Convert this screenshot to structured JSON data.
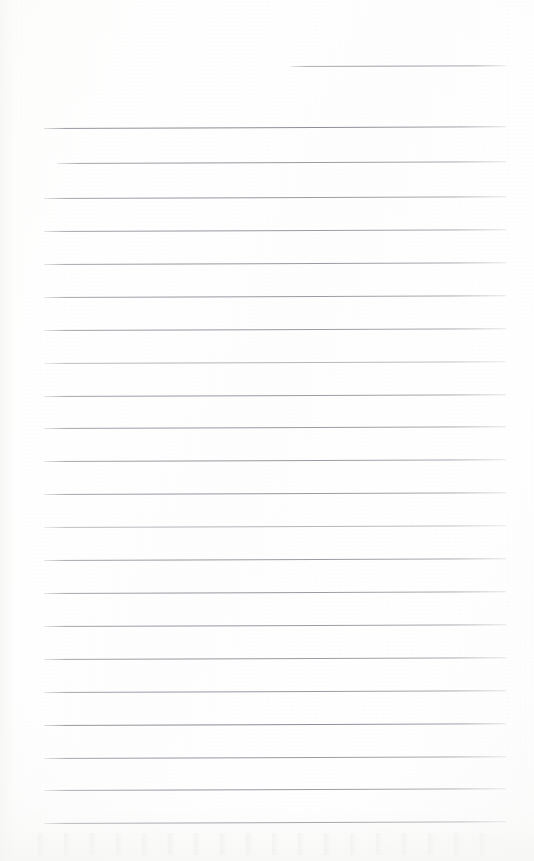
{
  "document": {
    "kind": "scanned-ruled-notebook-page",
    "title": "Blank Ruled Notebook Page",
    "description": "A scanned blank sheet of ruled notepaper. No handwriting, printed text, headings or page numbers are visible anywhere on the page.",
    "page_width": 534,
    "page_height": 861,
    "text_content": "",
    "has_visible_text": false,
    "paper_color": "#fefefe",
    "rule_color": "#9a9ca4",
    "rule_count": 24,
    "rule_left": 44,
    "rule_right": 506,
    "rule_spacing": 32.7,
    "skew_degrees": -0.22
  },
  "rules": [
    {
      "id": "rule-partial-top",
      "y": 66,
      "left": 290,
      "right": 506,
      "weight": "partial"
    },
    {
      "id": "rule-1",
      "y": 128,
      "left": 44,
      "right": 506,
      "weight": "strong"
    },
    {
      "id": "rule-2",
      "y": 163,
      "left": 57,
      "right": 506,
      "weight": "normal"
    },
    {
      "id": "rule-3",
      "y": 198,
      "left": 44,
      "right": 506,
      "weight": "normal"
    },
    {
      "id": "rule-4",
      "y": 231,
      "left": 44,
      "right": 506,
      "weight": "normal"
    },
    {
      "id": "rule-5",
      "y": 264,
      "left": 44,
      "right": 506,
      "weight": "normal"
    },
    {
      "id": "rule-6",
      "y": 297,
      "left": 44,
      "right": 506,
      "weight": "normal"
    },
    {
      "id": "rule-7",
      "y": 330,
      "left": 44,
      "right": 506,
      "weight": "normal"
    },
    {
      "id": "rule-8",
      "y": 363,
      "left": 44,
      "right": 506,
      "weight": "faint"
    },
    {
      "id": "rule-9",
      "y": 396,
      "left": 44,
      "right": 506,
      "weight": "normal"
    },
    {
      "id": "rule-10",
      "y": 428,
      "left": 44,
      "right": 506,
      "weight": "normal"
    },
    {
      "id": "rule-11",
      "y": 461,
      "left": 44,
      "right": 506,
      "weight": "normal"
    },
    {
      "id": "rule-12",
      "y": 494,
      "left": 44,
      "right": 506,
      "weight": "normal"
    },
    {
      "id": "rule-13",
      "y": 527,
      "left": 44,
      "right": 506,
      "weight": "faint"
    },
    {
      "id": "rule-14",
      "y": 560,
      "left": 44,
      "right": 506,
      "weight": "normal"
    },
    {
      "id": "rule-15",
      "y": 593,
      "left": 44,
      "right": 506,
      "weight": "normal"
    },
    {
      "id": "rule-16",
      "y": 626,
      "left": 44,
      "right": 506,
      "weight": "normal"
    },
    {
      "id": "rule-17",
      "y": 659,
      "left": 44,
      "right": 506,
      "weight": "normal"
    },
    {
      "id": "rule-18",
      "y": 692,
      "left": 44,
      "right": 506,
      "weight": "normal"
    },
    {
      "id": "rule-19",
      "y": 725,
      "left": 44,
      "right": 506,
      "weight": "strong"
    },
    {
      "id": "rule-20",
      "y": 758,
      "left": 44,
      "right": 506,
      "weight": "normal"
    },
    {
      "id": "rule-21",
      "y": 790,
      "left": 44,
      "right": 506,
      "weight": "normal"
    },
    {
      "id": "rule-22",
      "y": 823,
      "left": 44,
      "right": 506,
      "weight": "strong"
    }
  ]
}
